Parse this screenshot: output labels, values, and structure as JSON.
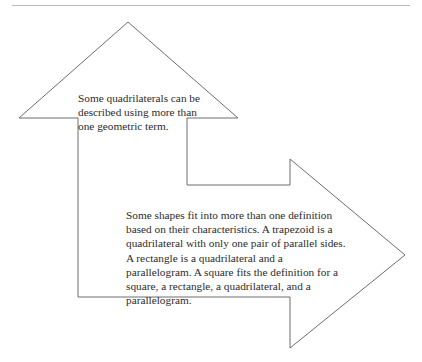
{
  "page": {
    "background_color": "#ffffff",
    "width": 422,
    "height": 362
  },
  "top_rule": {
    "name": "horizontal-rule",
    "color": "#b9b9b9"
  },
  "diagram": {
    "type": "bent-arrow-callout",
    "stroke_color": "#6d6d6d",
    "fill_color": "#ffffff",
    "stroke_width": 1,
    "points": "128,22 19,118 78,118 78,297 290,297 290,348 405,255 290,159 290,185 187,185 187,118 238,118"
  },
  "text_blocks": [
    {
      "name": "text-upper",
      "text": "Some quadrilaterals can be described using more than one geometric term.",
      "color": "#2c2c2c"
    },
    {
      "name": "text-lower",
      "text": "Some shapes fit into more than one definition based on their characteristics.  A trapezoid is a quadrilateral with only one pair of parallel sides.  A rectangle is a quadrilateral and a parallelogram.  A square fits the definition for a square, a rectangle, a quadrilateral, and a parallelogram.",
      "color": "#2c2c2c"
    }
  ]
}
